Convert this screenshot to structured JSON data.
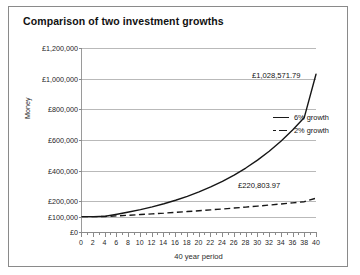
{
  "chart": {
    "title": "Comparison of two investment growths",
    "y_axis_title": "Money",
    "x_axis_title": "40 year period"
  },
  "legend": {
    "position": "inside-right",
    "items": [
      {
        "label": "6% growth",
        "style": "solid",
        "swatch": "solid-line-icon"
      },
      {
        "label": "2% growth",
        "style": "dashed",
        "swatch": "dashed-line-icon"
      }
    ]
  },
  "annotations": [
    {
      "name": "end-value-6-percent",
      "text": "£1,028,571.79"
    },
    {
      "name": "end-value-2-percent",
      "text": "£220,803.97"
    }
  ],
  "chart_data": {
    "type": "line",
    "title": "Comparison of two investment growths",
    "xlabel": "40 year period",
    "ylabel": "Money",
    "xlim": [
      0,
      40
    ],
    "ylim": [
      0,
      1200000
    ],
    "grid": true,
    "legend_position": "inside-right",
    "x_tick_labels": [
      "0",
      "2",
      "4",
      "6",
      "8",
      "10",
      "12",
      "14",
      "16",
      "18",
      "20",
      "22",
      "24",
      "26",
      "28",
      "30",
      "32",
      "34",
      "36",
      "38",
      "40"
    ],
    "x_ticks": [
      0,
      2,
      4,
      6,
      8,
      10,
      12,
      14,
      16,
      18,
      20,
      22,
      24,
      26,
      28,
      30,
      32,
      34,
      36,
      38,
      40
    ],
    "x_minor_tick_step": 1,
    "y_tick_labels": [
      "£0",
      "£100,000",
      "£200,000",
      "£400,000",
      "£600,000",
      "£800,000",
      "£1,000,000",
      "£1,200,000"
    ],
    "y_ticks": [
      0,
      100000,
      200000,
      400000,
      600000,
      800000,
      1000000,
      1200000
    ],
    "x": [
      0,
      2,
      4,
      6,
      8,
      10,
      12,
      14,
      16,
      18,
      20,
      22,
      24,
      26,
      28,
      30,
      32,
      34,
      36,
      38,
      40
    ],
    "series": [
      {
        "name": "6% growth",
        "style": "solid",
        "end_value": 1028571.79,
        "values": [
          100000,
          100000,
          103000,
          115720,
          130030,
          146110,
          164180,
          184480,
          207290,
          232920,
          261720,
          294080,
          330440,
          371300,
          417210,
          468800,
          526780,
          591920,
          665120,
          747360,
          1028571.79
        ]
      },
      {
        "name": "2% growth",
        "style": "dashed",
        "end_value": 220803.97,
        "values": [
          100000,
          100000,
          101000,
          105060,
          109300,
          113720,
          118320,
          123110,
          128090,
          133270,
          138660,
          144260,
          150080,
          156130,
          162420,
          168960,
          175750,
          182800,
          190130,
          197750,
          220803.97
        ]
      }
    ]
  }
}
